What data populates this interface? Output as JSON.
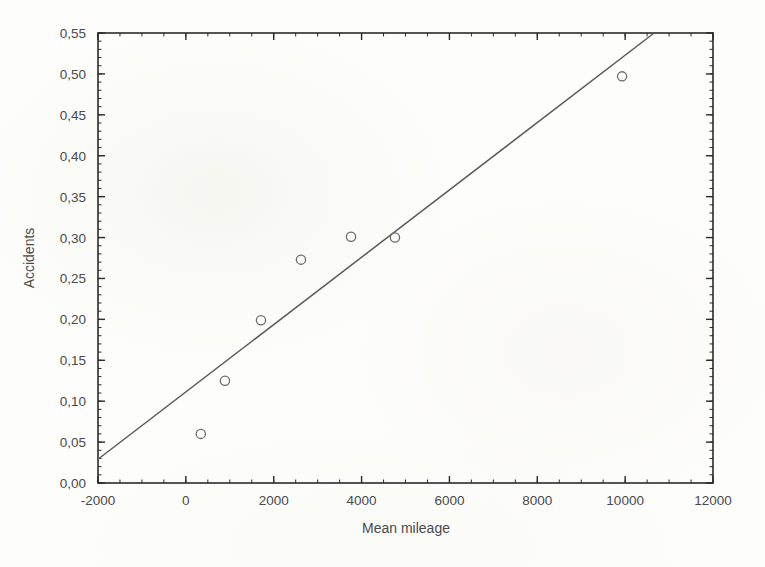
{
  "figure": {
    "background_color": "#fdfdfb",
    "axis_color": "#2b2b2b",
    "line_color": "#5a5a5a",
    "marker_color": "#6b6b6b",
    "text_color": "#4a4a4a"
  },
  "chart_data": {
    "type": "scatter",
    "title": "",
    "xlabel": "Mean mileage",
    "ylabel": "Accidents",
    "xlim": [
      -2000,
      12000
    ],
    "ylim": [
      0.0,
      0.55
    ],
    "grid": false,
    "legend": false,
    "x_ticks": [
      -2000,
      0,
      2000,
      4000,
      6000,
      8000,
      10000,
      12000
    ],
    "x_tick_labels": [
      "-2000",
      "0",
      "2000",
      "4000",
      "6000",
      "8000",
      "10000",
      "12000"
    ],
    "x_minor_step": 500,
    "y_ticks": [
      0.0,
      0.05,
      0.1,
      0.15,
      0.2,
      0.25,
      0.3,
      0.35,
      0.4,
      0.45,
      0.5,
      0.55
    ],
    "y_tick_labels": [
      "0,00",
      "0,05",
      "0,10",
      "0,15",
      "0,20",
      "0,25",
      "0,30",
      "0,35",
      "0,40",
      "0,45",
      "0,50",
      "0,55"
    ],
    "y_minor_step": 0.01,
    "decimal_separator": ",",
    "marker_style": "open-circle",
    "points": {
      "x": [
        340,
        890,
        1710,
        2620,
        3760,
        4760,
        9930
      ],
      "y": [
        0.06,
        0.125,
        0.199,
        0.273,
        0.301,
        0.3,
        0.497
      ]
    },
    "series": [
      {
        "name": "Accidents vs mean mileage",
        "type": "scatter",
        "x": [
          340,
          890,
          1710,
          2620,
          3760,
          4760,
          9930
        ],
        "y": [
          0.06,
          0.125,
          0.199,
          0.273,
          0.301,
          0.3,
          0.497
        ]
      },
      {
        "name": "regression line",
        "type": "line",
        "x": [
          -2000,
          10660
        ],
        "y": [
          0.029,
          0.55
        ]
      }
    ],
    "fit_line": {
      "x_start": -2000,
      "y_start": 0.029,
      "x_end": 10660,
      "y_end": 0.55,
      "slope": 4.12e-05,
      "intercept": 0.1113
    }
  }
}
